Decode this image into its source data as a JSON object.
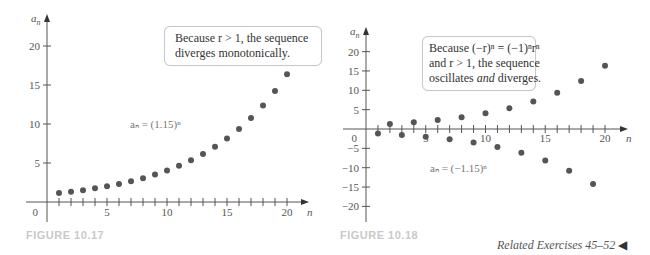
{
  "figures": [
    {
      "caption": "FIGURE 10.17",
      "callout": {
        "line1": "Because r > 1, the sequence",
        "line2": "diverges monotonically."
      },
      "formula": "aₙ = (1.15)ⁿ"
    },
    {
      "caption": "FIGURE 10.18",
      "callout": {
        "line1": "Because (−r)ⁿ = (−1)ⁿrⁿ",
        "line2": "and r > 1, the sequence",
        "line3_pre": "oscillates ",
        "line3_em": "and",
        "line3_post": " diverges."
      },
      "formula": "aₙ = (−1.15)ⁿ"
    }
  ],
  "related_exercises": "Related Exercises 45–52",
  "chart_data": [
    {
      "type": "scatter",
      "title": "FIGURE 10.17",
      "annotation": "Because r > 1, the sequence diverges monotonically.",
      "series_label": "a_n = (1.15)^n",
      "xlabel": "n",
      "ylabel": "a_n",
      "x_ticks": [
        5,
        10,
        15,
        20
      ],
      "y_ticks": [
        5,
        10,
        15,
        20
      ],
      "xlim": [
        0,
        21
      ],
      "ylim": [
        0,
        22
      ],
      "x": [
        1,
        2,
        3,
        4,
        5,
        6,
        7,
        8,
        9,
        10,
        11,
        12,
        13,
        14,
        15,
        16,
        17,
        18,
        19,
        20
      ],
      "values": [
        1.15,
        1.32,
        1.52,
        1.75,
        2.01,
        2.31,
        2.66,
        3.06,
        3.52,
        4.05,
        4.65,
        5.35,
        6.15,
        7.08,
        8.14,
        9.36,
        10.76,
        12.38,
        14.23,
        16.37
      ]
    },
    {
      "type": "scatter",
      "title": "FIGURE 10.18",
      "annotation": "Because (-r)^n = (-1)^n r^n and r > 1, the sequence oscillates and diverges.",
      "series_label": "a_n = (-1.15)^n",
      "xlabel": "n",
      "ylabel": "a_n",
      "x_ticks": [
        5,
        10,
        15,
        20
      ],
      "y_ticks": [
        -20,
        -15,
        -10,
        -5,
        5,
        10,
        15,
        20
      ],
      "xlim": [
        0,
        21
      ],
      "ylim": [
        -23,
        22
      ],
      "x": [
        1,
        2,
        3,
        4,
        5,
        6,
        7,
        8,
        9,
        10,
        11,
        12,
        13,
        14,
        15,
        16,
        17,
        18,
        19,
        20
      ],
      "values": [
        -1.15,
        1.32,
        -1.52,
        1.75,
        -2.01,
        2.31,
        -2.66,
        3.06,
        -3.52,
        4.05,
        -4.65,
        5.35,
        -6.15,
        7.08,
        -8.14,
        9.36,
        -10.76,
        12.38,
        -14.23,
        16.37
      ]
    }
  ]
}
